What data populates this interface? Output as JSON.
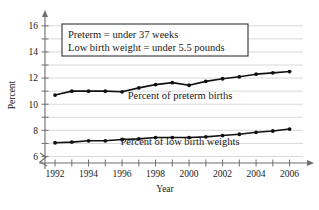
{
  "chart_data": {
    "type": "line",
    "title": "",
    "xlabel": "Year",
    "ylabel": "Percent",
    "x": [
      1992,
      1993,
      1994,
      1995,
      1996,
      1997,
      1998,
      1999,
      2000,
      2001,
      2002,
      2003,
      2004,
      2005,
      2006
    ],
    "xlim": [
      1991.4,
      2006.8
    ],
    "ylim": [
      5.5,
      16.6
    ],
    "grid": true,
    "legend_position": "inline-annotations",
    "y_axis_break": true,
    "x_tick_labels": [
      "1992",
      "1994",
      "1996",
      "1998",
      "2000",
      "2002",
      "2004",
      "2006"
    ],
    "x_tick_label_values": [
      1992,
      1994,
      1996,
      1998,
      2000,
      2002,
      2004,
      2006
    ],
    "x_tick_values": [
      1992,
      1993,
      1994,
      1995,
      1996,
      1997,
      1998,
      1999,
      2000,
      2001,
      2002,
      2003,
      2004,
      2005,
      2006
    ],
    "y_tick_values": [
      6,
      7,
      8,
      9,
      10,
      11,
      12,
      13,
      14,
      15,
      16
    ],
    "y_tick_labels": [
      "6",
      "8",
      "10",
      "12",
      "14",
      "16"
    ],
    "y_tick_label_values": [
      6,
      8,
      10,
      12,
      14,
      16
    ],
    "series": [
      {
        "name": "Percent of preterm births",
        "label": "Percent of preterm births",
        "color": "#111111",
        "values": [
          10.7,
          11.0,
          11.0,
          11.0,
          10.95,
          11.25,
          11.5,
          11.65,
          11.45,
          11.75,
          11.95,
          12.1,
          12.3,
          12.4,
          12.5
        ]
      },
      {
        "name": "Percent of low birth weights",
        "label": "Percent of low birth weights",
        "color": "#111111",
        "values": [
          7.05,
          7.1,
          7.2,
          7.2,
          7.3,
          7.35,
          7.45,
          7.45,
          7.45,
          7.5,
          7.6,
          7.7,
          7.85,
          7.95,
          8.1
        ]
      }
    ],
    "annotations": [
      {
        "name": "definition-box",
        "lines": [
          "Preterm = under 37 weeks",
          "Low birth weight = under 5.5 pounds"
        ]
      }
    ]
  },
  "labels": {
    "note_line_1": "Preterm = under 37 weeks",
    "note_line_2": "Low birth weight = under 5.5 pounds",
    "series_1_label": "Percent of preterm births",
    "series_2_label": "Percent of low birth weights",
    "x_axis_title": "Year",
    "y_axis_title": "Percent"
  },
  "colors": {
    "line": "#111111",
    "grid": "#c9c9c9",
    "axis": "#6e6e6e",
    "text": "#1a1a1a",
    "background": "#ffffff"
  }
}
